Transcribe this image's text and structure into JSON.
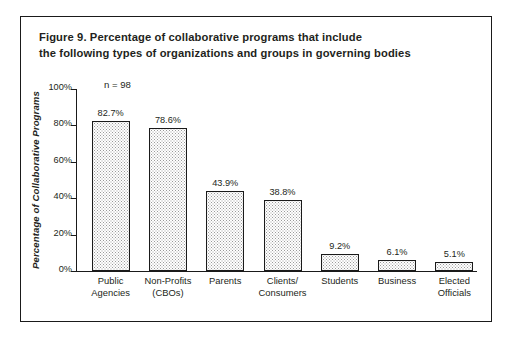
{
  "figure": {
    "title_line1": "Figure 9. Percentage of collaborative programs that include",
    "title_line2": "the following types of organizations and groups in governing bodies",
    "border_color": "#1a1a1a",
    "background": "#ffffff"
  },
  "annotation": {
    "sample_size": "n = 98"
  },
  "chart_data": {
    "type": "bar",
    "title": "Figure 9. Percentage of collaborative programs that include the following types of organizations and groups in governing bodies",
    "xlabel": "",
    "ylabel": "Percentage of Collaborative Programs",
    "ylim": [
      0,
      100
    ],
    "yticks": [
      0,
      20,
      40,
      60,
      80,
      100
    ],
    "ytick_labels": [
      "0%",
      "20%",
      "40%",
      "60%",
      "80%",
      "100%"
    ],
    "grid": false,
    "legend": false,
    "annotations": [
      "n = 98"
    ],
    "categories": [
      "Public Agencies",
      "Non-Profits (CBOs)",
      "Parents",
      "Clients/ Consumers",
      "Students",
      "Business",
      "Elected Officials"
    ],
    "category_lines": [
      [
        "Public",
        "Agencies"
      ],
      [
        "Non-Profits",
        "(CBOs)"
      ],
      [
        "Parents",
        ""
      ],
      [
        "Clients/",
        "Consumers"
      ],
      [
        "Students",
        ""
      ],
      [
        "Business",
        ""
      ],
      [
        "Elected",
        "Officials"
      ]
    ],
    "values": [
      82.7,
      78.6,
      43.9,
      38.8,
      9.2,
      6.1,
      5.1
    ],
    "value_labels": [
      "82.7%",
      "78.6%",
      "43.9%",
      "38.8%",
      "9.2%",
      "6.1%",
      "5.1%"
    ],
    "bar_style": {
      "fill": "dotted-gray-stipple",
      "fill_color": "#9a9a9a",
      "edge_color": "#1a1a1a"
    }
  }
}
